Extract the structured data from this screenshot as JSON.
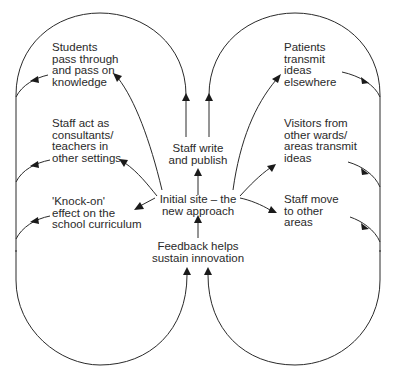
{
  "diagram": {
    "center": {
      "initial_site": "Initial site – the\nnew approach",
      "feedback": "Feedback helps\nsustain innovation",
      "staff_write": "Staff write\nand publish"
    },
    "left_outcomes": [
      {
        "label": "Students\npass through\nand pass on\nknowledge"
      },
      {
        "label": "Staff act as\nconsultants/\nteachers in\nother settings"
      },
      {
        "label": "'Knock-on'\neffect on the\nschool curriculum"
      }
    ],
    "right_outcomes": [
      {
        "label": "Patients\ntransmit\nideas\nelsewhere"
      },
      {
        "label": "Visitors from\nother wards/\nareas transmit\nideas"
      },
      {
        "label": "Staff move\nto other\nareas"
      }
    ],
    "colors": {
      "line": "#2a2a2a",
      "text": "#2a2a2a",
      "background": "#ffffff"
    }
  }
}
